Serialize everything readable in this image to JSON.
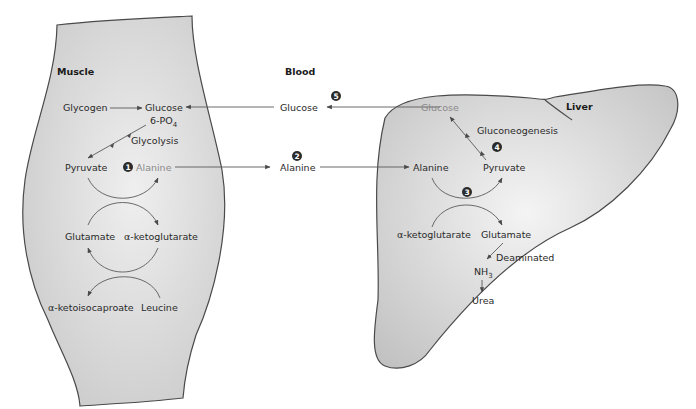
{
  "regions": {
    "muscle": "Muscle",
    "blood": "Blood",
    "liver": "Liver"
  },
  "muscle": {
    "glycogen": "Glycogen",
    "glucose": "Glucose",
    "glucose_sub": "6-PO",
    "glucose_sub_index": "4",
    "glycolysis": "Glycolysis",
    "pyruvate": "Pyruvate",
    "alanine": "Alanine",
    "glutamate": "Glutamate",
    "alpha_ketoglutarate": "α-ketoglutarate",
    "alpha_ketoisocaproate": "α-ketoisocaproate",
    "leucine": "Leucine"
  },
  "blood": {
    "glucose": "Glucose",
    "alanine": "Alanine"
  },
  "liver": {
    "glucose": "Glucose",
    "gluconeogenesis": "Gluconeogenesis",
    "alanine": "Alanine",
    "pyruvate": "Pyruvate",
    "alpha_ketoglutarate": "α-ketoglutarate",
    "glutamate": "Glutamate",
    "deaminated": "Deaminated",
    "nh3": "NH",
    "nh3_sub": "3",
    "urea": "Urea"
  },
  "steps": [
    "1",
    "2",
    "3",
    "4",
    "5"
  ],
  "colors": {
    "organ_fill": "#cfcfcf",
    "organ_stroke": "#4a4a4a",
    "step_badge": "#2b2b2b"
  }
}
